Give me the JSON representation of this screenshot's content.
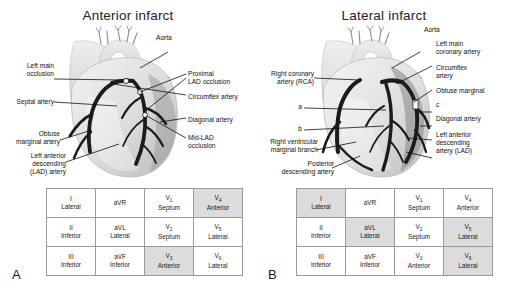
{
  "figure": {
    "panels": [
      {
        "letter": "A",
        "title": "Anterior infarct",
        "labels": [
          {
            "name": "aorta",
            "text": "Aorta"
          },
          {
            "name": "left-main-occlusion",
            "text": "Left main\nocclusion"
          },
          {
            "name": "septal-artery",
            "text": "Septal artery"
          },
          {
            "name": "obtuse-marginal-artery",
            "text": "Obtuse\nmarginal artery"
          },
          {
            "name": "left-anterior-descending-lad-artery",
            "text": "Left anterior\ndescending\n(LAD) artery"
          },
          {
            "name": "proximal-lad-occlusion",
            "text": "Proximal\nLAD occlusion"
          },
          {
            "name": "circumflex-artery",
            "text": "Circumflex artery"
          },
          {
            "name": "diagonal-artery",
            "text": "Diagonal artery"
          },
          {
            "name": "mid-lad-occlusion",
            "text": "Mid-LAD\nocclusion"
          }
        ],
        "ecg_grid": {
          "rows": [
            [
              {
                "lead": "I",
                "sub": "",
                "region": "Lateral",
                "highlight": false
              },
              {
                "lead": "aVR",
                "sub": "",
                "region": "",
                "highlight": false
              },
              {
                "lead": "V",
                "sub": "1",
                "region": "Septum",
                "highlight": false
              },
              {
                "lead": "V",
                "sub": "4",
                "region": "Anterior",
                "highlight": true
              }
            ],
            [
              {
                "lead": "II",
                "sub": "",
                "region": "Inferior",
                "highlight": false
              },
              {
                "lead": "aVL",
                "sub": "",
                "region": "Lateral",
                "highlight": false
              },
              {
                "lead": "V",
                "sub": "2",
                "region": "Septum",
                "highlight": false
              },
              {
                "lead": "V",
                "sub": "5",
                "region": "Lateral",
                "highlight": false
              }
            ],
            [
              {
                "lead": "III",
                "sub": "",
                "region": "Inferior",
                "highlight": false
              },
              {
                "lead": "aVF",
                "sub": "",
                "region": "Inferior",
                "highlight": false
              },
              {
                "lead": "V",
                "sub": "3",
                "region": "Anterior",
                "highlight": true
              },
              {
                "lead": "V",
                "sub": "6",
                "region": "Lateral",
                "highlight": false
              }
            ]
          ]
        }
      },
      {
        "letter": "B",
        "title": "Lateral infarct",
        "labels": [
          {
            "name": "aorta",
            "text": "Aorta"
          },
          {
            "name": "right-coronary-artery-rca",
            "text": "Right coronary\nartery (RCA)"
          },
          {
            "name": "marker-a",
            "text": "a"
          },
          {
            "name": "marker-b",
            "text": "b"
          },
          {
            "name": "right-ventricular-marginal-branch",
            "text": "Right ventricular\nmarginal branch"
          },
          {
            "name": "posterior-descending-artery",
            "text": "Posterior\ndescending artery"
          },
          {
            "name": "left-main-coronary-artery",
            "text": "Left main\ncoronary artery"
          },
          {
            "name": "circumflex-artery",
            "text": "Circumflex\nartery"
          },
          {
            "name": "obtuse-marginal",
            "text": "Obtuse marginal"
          },
          {
            "name": "marker-c",
            "text": "c"
          },
          {
            "name": "diagonal-artery",
            "text": "Diagonal artery"
          },
          {
            "name": "left-anterior-descending-artery-lad",
            "text": "Left anterior\ndescending\nartery (LAD)"
          }
        ],
        "ecg_grid": {
          "rows": [
            [
              {
                "lead": "I",
                "sub": "",
                "region": "Lateral",
                "highlight": true
              },
              {
                "lead": "aVR",
                "sub": "",
                "region": "",
                "highlight": false
              },
              {
                "lead": "V",
                "sub": "1",
                "region": "Septum",
                "highlight": false
              },
              {
                "lead": "V",
                "sub": "4",
                "region": "Anterior",
                "highlight": false
              }
            ],
            [
              {
                "lead": "II",
                "sub": "",
                "region": "Inferior",
                "highlight": false
              },
              {
                "lead": "aVL",
                "sub": "",
                "region": "Lateral",
                "highlight": true
              },
              {
                "lead": "V",
                "sub": "2",
                "region": "Septum",
                "highlight": false
              },
              {
                "lead": "V",
                "sub": "5",
                "region": "Lateral",
                "highlight": true
              }
            ],
            [
              {
                "lead": "III",
                "sub": "",
                "region": "Inferior",
                "highlight": false
              },
              {
                "lead": "aVF",
                "sub": "",
                "region": "Inferior",
                "highlight": false
              },
              {
                "lead": "V",
                "sub": "3",
                "region": "Anterior",
                "highlight": false
              },
              {
                "lead": "V",
                "sub": "6",
                "region": "Lateral",
                "highlight": true
              }
            ]
          ]
        }
      }
    ],
    "colors": {
      "highlight_fill": "#dcdcdc",
      "grid_border": "#9a9a9a",
      "artery_dark": "#1b1b1b",
      "heart_light": "#e8e8e8",
      "heart_mid": "#cfcfcf",
      "heart_shadow": "#a8a8a8",
      "text": "#1a1a1a"
    }
  }
}
